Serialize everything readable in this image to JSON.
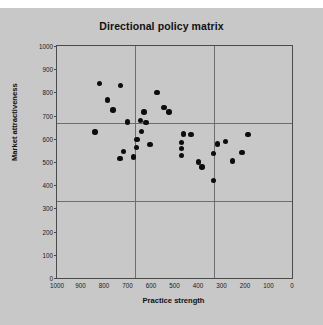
{
  "chart_data": {
    "type": "scatter",
    "title": "Directional policy matrix",
    "xlabel": "Practice strength",
    "ylabel": "Market attractiveness",
    "xlim": [
      1000,
      0
    ],
    "ylim": [
      0,
      1000
    ],
    "x_reversed": true,
    "grid": true,
    "legend": "none",
    "xticks": [
      1000,
      900,
      800,
      700,
      600,
      500,
      400,
      300,
      200,
      100,
      0
    ],
    "yticks": [
      0,
      100,
      200,
      300,
      400,
      500,
      600,
      700,
      800,
      900,
      1000
    ],
    "quadrant_lines": {
      "vertical": [
        667,
        333
      ],
      "horizontal": [
        667,
        333
      ]
    },
    "marker": {
      "shape": "circle",
      "color": "#0d0d0d",
      "size": 5.4
    },
    "background_color": "#c8c8c8",
    "points": [
      {
        "x": 818,
        "y": 838
      },
      {
        "x": 730,
        "y": 830
      },
      {
        "x": 785,
        "y": 768
      },
      {
        "x": 762,
        "y": 725
      },
      {
        "x": 575,
        "y": 800
      },
      {
        "x": 629,
        "y": 715
      },
      {
        "x": 700,
        "y": 672
      },
      {
        "x": 545,
        "y": 735
      },
      {
        "x": 645,
        "y": 680
      },
      {
        "x": 622,
        "y": 670
      },
      {
        "x": 838,
        "y": 630
      },
      {
        "x": 523,
        "y": 715
      },
      {
        "x": 640,
        "y": 632
      },
      {
        "x": 463,
        "y": 620
      },
      {
        "x": 430,
        "y": 618
      },
      {
        "x": 660,
        "y": 597
      },
      {
        "x": 470,
        "y": 585
      },
      {
        "x": 605,
        "y": 575
      },
      {
        "x": 663,
        "y": 562
      },
      {
        "x": 470,
        "y": 558
      },
      {
        "x": 718,
        "y": 545
      },
      {
        "x": 732,
        "y": 515
      },
      {
        "x": 283,
        "y": 588
      },
      {
        "x": 318,
        "y": 578
      },
      {
        "x": 470,
        "y": 528
      },
      {
        "x": 334,
        "y": 537
      },
      {
        "x": 675,
        "y": 522
      },
      {
        "x": 398,
        "y": 500
      },
      {
        "x": 383,
        "y": 478
      },
      {
        "x": 188,
        "y": 618
      },
      {
        "x": 212,
        "y": 540
      },
      {
        "x": 253,
        "y": 505
      },
      {
        "x": 335,
        "y": 420
      }
    ]
  }
}
